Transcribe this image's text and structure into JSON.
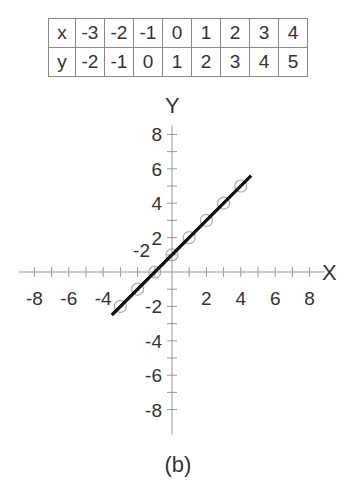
{
  "table": {
    "row_labels": [
      "x",
      "y"
    ],
    "x": [
      "-3",
      "-2",
      "-1",
      "0",
      "1",
      "2",
      "3",
      "4"
    ],
    "y": [
      "-2",
      "-1",
      "0",
      "1",
      "2",
      "3",
      "4",
      "5"
    ]
  },
  "caption": "(b)",
  "chart_data": {
    "type": "scatter",
    "title": "",
    "xlabel": "X",
    "ylabel": "Y",
    "xlim": [
      -9,
      9
    ],
    "ylim": [
      -9,
      9
    ],
    "x_tick_labels": [
      "-8",
      "-6",
      "-4",
      "2",
      "4",
      "6",
      "8"
    ],
    "y_tick_labels": [
      "8",
      "6",
      "4",
      "2",
      "-2",
      "-4",
      "-6",
      "-8"
    ],
    "extra_labels": [
      "-2"
    ],
    "grid": false,
    "series": [
      {
        "name": "points",
        "marker": "open-circle",
        "x": [
          -3,
          -2,
          -1,
          0,
          1,
          2,
          3,
          4
        ],
        "y": [
          -2,
          -1,
          0,
          1,
          2,
          3,
          4,
          5
        ]
      },
      {
        "name": "line y = x + 1",
        "type": "line",
        "x": [
          -3.5,
          4.6
        ],
        "y": [
          -2.5,
          5.6
        ]
      }
    ],
    "caption": "(b)"
  }
}
